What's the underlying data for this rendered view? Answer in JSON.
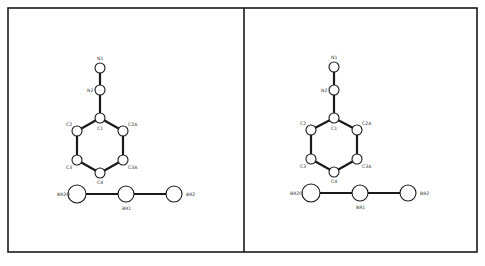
{
  "figure": {
    "colors": {
      "line": "#1a1a1a",
      "background": "#ffffff",
      "label": "#333333"
    },
    "frame": {
      "x": 8,
      "y": 8,
      "width": 469,
      "height": 244,
      "divider_x": 244
    }
  },
  "panels": [
    {
      "name": "left-view",
      "offset_x": 0,
      "atoms": [
        {
          "id": "N1",
          "label": "N1",
          "x": 100,
          "y": 68,
          "r": 5,
          "lx": 97,
          "ly": 60
        },
        {
          "id": "N2",
          "label": "N2",
          "x": 100,
          "y": 90,
          "r": 5,
          "lx": 87,
          "ly": 92
        },
        {
          "id": "C1",
          "label": "C1",
          "x": 100,
          "y": 118,
          "r": 5,
          "lx": 97,
          "ly": 130
        },
        {
          "id": "C2",
          "label": "C2",
          "x": 77,
          "y": 131,
          "r": 5,
          "lx": 66,
          "ly": 126
        },
        {
          "id": "C2A",
          "label": "C2A",
          "x": 123,
          "y": 131,
          "r": 5,
          "lx": 128,
          "ly": 126
        },
        {
          "id": "C3",
          "label": "C3",
          "x": 77,
          "y": 160,
          "r": 5,
          "lx": 66,
          "ly": 169
        },
        {
          "id": "C3A",
          "label": "C3A",
          "x": 123,
          "y": 160,
          "r": 5,
          "lx": 128,
          "ly": 169
        },
        {
          "id": "C4",
          "label": "C4",
          "x": 100,
          "y": 173,
          "r": 5,
          "lx": 97,
          "ly": 184
        },
        {
          "id": "BR2O",
          "label": "BR2O",
          "x": 77,
          "y": 194,
          "r": 9,
          "lx": 57,
          "ly": 196
        },
        {
          "id": "BR1",
          "label": "BR1",
          "x": 126,
          "y": 194,
          "r": 8,
          "lx": 122,
          "ly": 210
        },
        {
          "id": "BR2",
          "label": "BR2",
          "x": 174,
          "y": 194,
          "r": 8,
          "lx": 186,
          "ly": 196
        }
      ]
    },
    {
      "name": "right-view",
      "offset_x": 234,
      "atoms": [
        {
          "id": "N1",
          "label": "N1",
          "x": 334,
          "y": 67,
          "r": 5,
          "lx": 331,
          "ly": 59
        },
        {
          "id": "N2",
          "label": "N2",
          "x": 334,
          "y": 90,
          "r": 5,
          "lx": 321,
          "ly": 92
        },
        {
          "id": "C1",
          "label": "C1",
          "x": 334,
          "y": 118,
          "r": 5,
          "lx": 331,
          "ly": 130
        },
        {
          "id": "C2",
          "label": "C2",
          "x": 311,
          "y": 130,
          "r": 5,
          "lx": 300,
          "ly": 125
        },
        {
          "id": "C2A",
          "label": "C2A",
          "x": 357,
          "y": 130,
          "r": 5,
          "lx": 362,
          "ly": 125
        },
        {
          "id": "C3",
          "label": "C3",
          "x": 311,
          "y": 159,
          "r": 5,
          "lx": 300,
          "ly": 168
        },
        {
          "id": "C3A",
          "label": "C3A",
          "x": 357,
          "y": 159,
          "r": 5,
          "lx": 362,
          "ly": 168
        },
        {
          "id": "C4",
          "label": "C4",
          "x": 334,
          "y": 172,
          "r": 5,
          "lx": 331,
          "ly": 183
        },
        {
          "id": "BR2O",
          "label": "BR2O",
          "x": 311,
          "y": 193,
          "r": 9,
          "lx": 290,
          "ly": 195
        },
        {
          "id": "BR1",
          "label": "BR1",
          "x": 360,
          "y": 193,
          "r": 8,
          "lx": 356,
          "ly": 209
        },
        {
          "id": "BR2",
          "label": "BR2",
          "x": 408,
          "y": 193,
          "r": 8,
          "lx": 420,
          "ly": 195
        }
      ]
    }
  ],
  "bonds": [
    [
      "N1",
      "N2"
    ],
    [
      "N2",
      "C1"
    ],
    [
      "C1",
      "C2"
    ],
    [
      "C1",
      "C2A"
    ],
    [
      "C2",
      "C3"
    ],
    [
      "C2A",
      "C3A"
    ],
    [
      "C3",
      "C4"
    ],
    [
      "C3A",
      "C4"
    ],
    [
      "BR2O",
      "BR1"
    ],
    [
      "BR1",
      "BR2"
    ]
  ]
}
